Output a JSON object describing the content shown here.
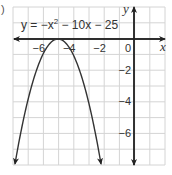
{
  "part_label": ")",
  "chart_data": {
    "type": "line",
    "equation_parts": {
      "lhs": "y = −x",
      "sup": "2",
      "rhs": " − 10x − 25"
    },
    "xlabel": "x",
    "ylabel": "y",
    "xlim": [
      -8,
      2
    ],
    "ylim": [
      -8,
      2
    ],
    "grid": true,
    "x_ticks": [
      {
        "value": -6,
        "label": "−6"
      },
      {
        "value": -4,
        "label": "−4"
      },
      {
        "value": -2,
        "label": "−2"
      },
      {
        "value": 0,
        "label": "0"
      }
    ],
    "y_ticks": [
      {
        "value": -2,
        "label": "−2"
      },
      {
        "value": -4,
        "label": "−4"
      },
      {
        "value": -6,
        "label": "−6"
      }
    ],
    "series": [
      {
        "name": "y = −x² − 10x − 25",
        "vertex": [
          -5,
          0
        ],
        "x": [
          -7.83,
          -7,
          -6.5,
          -6,
          -5.5,
          -5,
          -4.5,
          -4,
          -3.5,
          -3,
          -2.17
        ],
        "y": [
          -8,
          -4,
          -2.25,
          -1,
          -0.25,
          0,
          -0.25,
          -1,
          -2.25,
          -4,
          -8
        ]
      }
    ],
    "colors": {
      "grid": "#d4d4d4",
      "axis": "#222222",
      "curve": "#333333"
    }
  }
}
